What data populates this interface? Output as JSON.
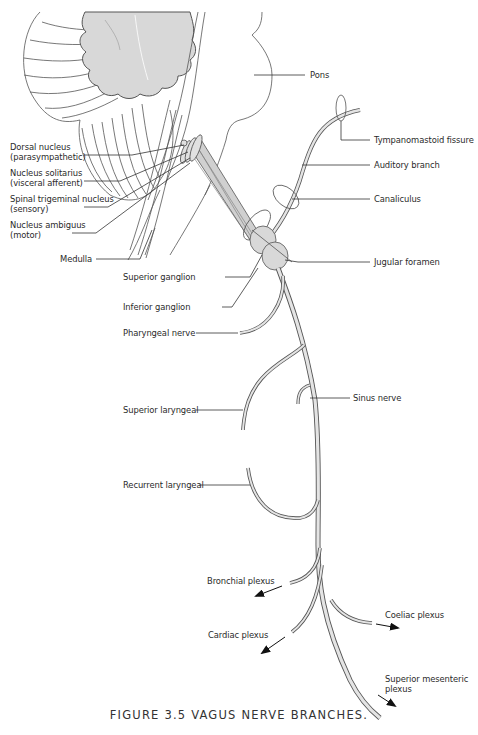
{
  "figure": {
    "caption": "FIGURE 3.5 VAGUS NERVE BRANCHES.",
    "colors": {
      "line": "#555555",
      "fill_gray": "#d8d8d8",
      "nerve_fill": "#e4e4e4",
      "text": "#2a2a2a"
    }
  },
  "labels": {
    "pons": "Pons",
    "dorsal_nucleus": [
      "Dorsal nucleus",
      "(parasympathetic)"
    ],
    "nucleus_solitarius": [
      "Nucleus solitarius",
      "(visceral afferent)"
    ],
    "spinal_trigeminal": [
      "Spinal  trigeminal nucleus",
      "(sensory)"
    ],
    "nucleus_ambiguus": [
      "Nucleus ambiguus",
      "(motor)"
    ],
    "medulla": "Medulla",
    "tympanomastoid": "Tympanomastoid fissure",
    "auditory_branch": "Auditory branch",
    "canaliculus": "Canaliculus",
    "jugular_foramen": "Jugular foramen",
    "superior_ganglion": "Superior ganglion",
    "inferior_ganglion": "Inferior ganglion",
    "pharyngeal_nerve": "Pharyngeal nerve",
    "sinus_nerve": "Sinus nerve",
    "superior_laryngeal": "Superior laryngeal",
    "recurrent_laryngeal": "Recurrent laryngeal",
    "bronchial_plexus": "Bronchial plexus",
    "coeliac_plexus": "Coeliac plexus",
    "cardiac_plexus": "Cardiac plexus",
    "superior_mesenteric": [
      "Superior mesenteric",
      "plexus"
    ]
  }
}
